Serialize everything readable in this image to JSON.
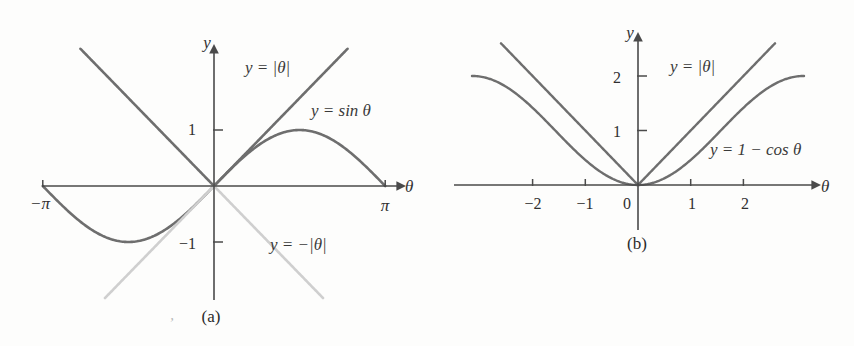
{
  "figure": {
    "panels": [
      {
        "id": "a",
        "caption": "(a)",
        "stray_mark": ",",
        "axis": {
          "x_name": "θ",
          "y_name": "y",
          "x_ticks": [
            {
              "value": -3.14159,
              "label": "−π"
            },
            {
              "value": 3.14159,
              "label": "π"
            }
          ],
          "y_ticks": [
            {
              "value": 1,
              "label": "1"
            },
            {
              "value": -1,
              "label": "−1"
            }
          ],
          "xlim": [
            -3.6,
            3.6
          ],
          "ylim": [
            -2.4,
            2.3
          ]
        },
        "curve_labels": [
          {
            "name": "abs-theta",
            "text": "y = |θ|",
            "x": 245,
            "y": 73
          },
          {
            "name": "sin-theta",
            "text": "y = sin θ",
            "x": 311,
            "y": 116
          },
          {
            "name": "neg-abs-theta",
            "text": "y = −|θ|",
            "x": 270,
            "y": 250
          }
        ]
      },
      {
        "id": "b",
        "caption": "(b)",
        "axis": {
          "x_name": "θ",
          "y_name": "y",
          "x_ticks": [
            {
              "value": -2,
              "label": "−2"
            },
            {
              "value": -1,
              "label": "−1"
            },
            {
              "value": 0,
              "label": "0"
            },
            {
              "value": 1,
              "label": "1"
            },
            {
              "value": 2,
              "label": "2"
            }
          ],
          "y_ticks": [
            {
              "value": 1,
              "label": "1"
            },
            {
              "value": 2,
              "label": "2"
            }
          ],
          "xlim": [
            -3.3,
            3.3
          ],
          "ylim": [
            -0.45,
            2.65
          ]
        },
        "curve_labels": [
          {
            "name": "abs-theta",
            "text": "y = |θ|",
            "x": 243,
            "y": 72
          },
          {
            "name": "one-minus-cos",
            "text": "y = 1 − cos θ",
            "x": 283,
            "y": 155
          }
        ]
      }
    ]
  },
  "chart_data": [
    {
      "type": "line",
      "panel": "a",
      "title": "",
      "xlabel": "θ",
      "ylabel": "y",
      "xlim": [
        -3.6,
        3.6
      ],
      "ylim": [
        -2.4,
        2.3
      ],
      "grid": false,
      "legend": "inline-annotations",
      "xticks": [
        -3.14159,
        3.14159
      ],
      "xticklabels": [
        "−π",
        "π"
      ],
      "yticks": [
        -1,
        1
      ],
      "yticklabels": [
        "−1",
        "1"
      ],
      "series": [
        {
          "name": "y = sin θ",
          "color": "#6e6e6e",
          "width": 2.6,
          "kind": "sin",
          "domain": [
            -3.14159,
            3.14159
          ],
          "x": [
            -3.14159,
            -2.74889,
            -2.35619,
            -1.9635,
            -1.5708,
            -1.1781,
            -0.7854,
            -0.3927,
            0,
            0.3927,
            0.7854,
            1.1781,
            1.5708,
            1.9635,
            2.35619,
            2.74889,
            3.14159
          ],
          "y": [
            0,
            -0.38268,
            -0.70711,
            -0.92388,
            -1,
            -0.92388,
            -0.70711,
            -0.38268,
            0,
            0.38268,
            0.70711,
            0.92388,
            1,
            0.92388,
            0.70711,
            0.38268,
            0
          ]
        },
        {
          "name": "y = |θ|",
          "color": "#6e6e6e",
          "width": 2.6,
          "kind": "abs",
          "domain": [
            -2.45,
            2.45
          ],
          "x": [
            -2.45,
            0,
            2.45
          ],
          "y": [
            2.45,
            0,
            2.45
          ]
        },
        {
          "name": "y = −|θ|",
          "color": "#cfcfcf",
          "width": 2.6,
          "kind": "neg-abs",
          "domain": [
            -2.0,
            2.0
          ],
          "x": [
            -2.0,
            0,
            2.0
          ],
          "y": [
            -2.0,
            0,
            -2.0
          ]
        }
      ]
    },
    {
      "type": "line",
      "panel": "b",
      "title": "",
      "xlabel": "θ",
      "ylabel": "y",
      "xlim": [
        -3.3,
        3.3
      ],
      "ylim": [
        -0.45,
        2.65
      ],
      "grid": false,
      "legend": "inline-annotations",
      "xticks": [
        -2,
        -1,
        0,
        1,
        2
      ],
      "xticklabels": [
        "−2",
        "−1",
        "0",
        "1",
        "2"
      ],
      "yticks": [
        1,
        2
      ],
      "yticklabels": [
        "1",
        "2"
      ],
      "series": [
        {
          "name": "y = |θ|",
          "color": "#6e6e6e",
          "width": 2.4,
          "kind": "abs",
          "domain": [
            -2.6,
            2.6
          ],
          "x": [
            -2.6,
            0,
            2.6
          ],
          "y": [
            2.6,
            0,
            2.6
          ]
        },
        {
          "name": "y = 1 − cos θ",
          "color": "#6e6e6e",
          "width": 2.4,
          "kind": "one-minus-cos",
          "domain": [
            -3.15,
            3.15
          ],
          "x": [
            -3.15,
            -2.8,
            -2.45,
            -2.1,
            -1.75,
            -1.4,
            -1.05,
            -0.7,
            -0.35,
            0,
            0.35,
            0.7,
            1.05,
            1.4,
            1.75,
            2.1,
            2.45,
            2.8,
            3.15
          ],
          "y": [
            2.0,
            1.942,
            1.771,
            1.505,
            1.178,
            0.83,
            0.502,
            0.235,
            0.0605,
            0,
            0.0605,
            0.235,
            0.502,
            0.83,
            1.178,
            1.505,
            1.771,
            1.942,
            2.0
          ]
        }
      ]
    }
  ],
  "colors": {
    "curve": "#6e6e6e",
    "faded_curve": "#cfcfcf",
    "axis": "#4a4a4a",
    "text": "#2b2b2b",
    "background": "#fdfdfc"
  }
}
